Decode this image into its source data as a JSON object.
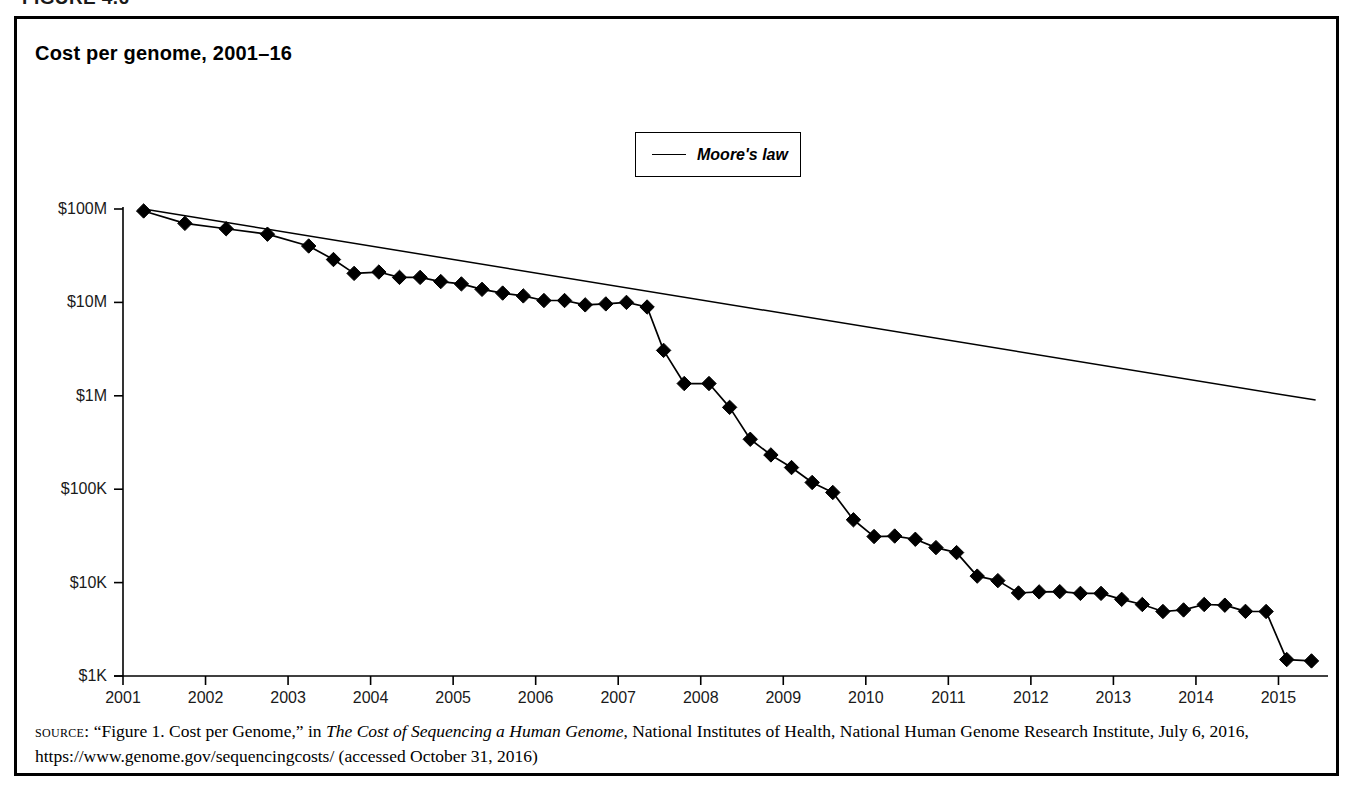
{
  "figure_caption": "FIGURE 4.6",
  "chart": {
    "title": "Cost per genome, 2001–16",
    "legend": {
      "items": [
        {
          "label": "Moore's law",
          "color": "#000000",
          "marker": "line"
        }
      ]
    }
  },
  "source": {
    "kicker": "source:",
    "part1": " “Figure 1. Cost per Genome,” in ",
    "italic1": "The Cost of Sequencing a Human Genome",
    "part2": ", National Institutes of Health, National Human Genome Research Institute, July 6, 2016, https://www.genome.gov/sequencingcosts/ (accessed October 31, 2016)"
  },
  "chart_data": {
    "type": "line",
    "title": "Cost per genome, 2001–16",
    "xlabel": "",
    "ylabel": "",
    "yscale": "log",
    "ylim": [
      1000,
      100000000
    ],
    "ytick_values": [
      1000,
      10000,
      100000,
      1000000,
      10000000,
      100000000
    ],
    "ytick_labels": [
      "$1K",
      "$10K",
      "$100K",
      "$1M",
      "$10M",
      "$100M"
    ],
    "xlim": [
      2001.0,
      2015.6
    ],
    "xtick_values": [
      2001,
      2002,
      2003,
      2004,
      2005,
      2006,
      2007,
      2008,
      2009,
      2010,
      2011,
      2012,
      2013,
      2014,
      2015
    ],
    "xtick_labels": [
      "2001",
      "2002",
      "2003",
      "2004",
      "2005",
      "2006",
      "2007",
      "2008",
      "2009",
      "2010",
      "2011",
      "2012",
      "2013",
      "2014",
      "2015"
    ],
    "grid": false,
    "legend_position": "upper center",
    "series": [
      {
        "name": "Cost per genome",
        "marker": "diamond",
        "color": "#000000",
        "x": [
          2001.25,
          2001.75,
          2002.25,
          2002.75,
          2003.25,
          2003.55,
          2003.8,
          2004.1,
          2004.35,
          2004.6,
          2004.85,
          2005.1,
          2005.35,
          2005.6,
          2005.85,
          2006.1,
          2006.35,
          2006.6,
          2006.85,
          2007.1,
          2007.35,
          2007.55,
          2007.8,
          2008.1,
          2008.35,
          2008.6,
          2008.85,
          2009.1,
          2009.35,
          2009.6,
          2009.85,
          2010.1,
          2010.35,
          2010.6,
          2010.85,
          2011.1,
          2011.35,
          2011.6,
          2011.85,
          2012.1,
          2012.35,
          2012.6,
          2012.85,
          2013.1,
          2013.35,
          2013.6,
          2013.85,
          2014.1,
          2014.35,
          2014.6,
          2014.85,
          2015.1,
          2015.4
        ],
        "y": [
          95263072,
          70175437,
          61448422,
          53751684,
          40157554,
          28780376,
          20442576,
          21135204,
          18519312,
          18519312,
          16712371,
          15769211,
          13801124,
          12585501,
          11732535,
          10474556,
          10474556,
          9408739,
          9635844,
          10000000,
          8927342,
          3063820,
          1352982,
          1352982,
          752080,
          342502,
          232735,
          170500,
          118025,
          92233,
          47050,
          31125,
          31512,
          29092,
          23700,
          20963,
          11732,
          10497,
          7743,
          7950,
          8000,
          7666,
          7665,
          6618,
          5826,
          4905,
          5096,
          5826,
          5731,
          4920,
          4905,
          1500,
          1450
        ]
      },
      {
        "name": "Moore's law",
        "marker": "none",
        "color": "#000000",
        "x": [
          2001.25,
          2015.45
        ],
        "y": [
          100000000,
          900000
        ]
      }
    ]
  }
}
